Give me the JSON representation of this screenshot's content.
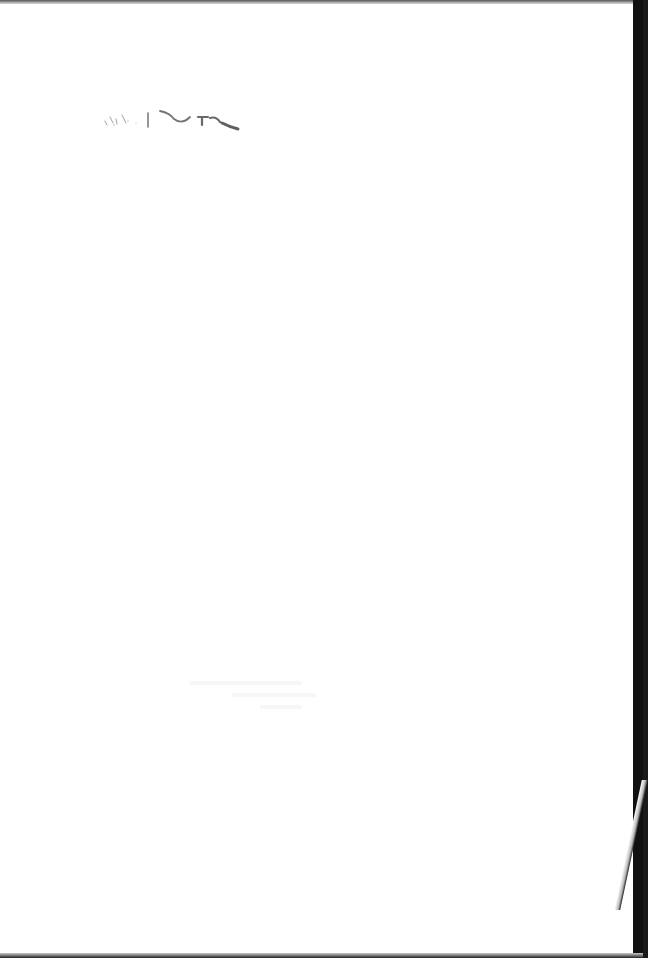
{
  "document": {
    "type": "scanned-page",
    "content": "blank",
    "marks": [
      {
        "name": "ink-smudge",
        "position": "top-left",
        "legible": false
      },
      {
        "name": "bleed-through",
        "position": "center-lower",
        "legible": false
      }
    ]
  },
  "colors": {
    "paper": "#ffffff",
    "border": "#111111",
    "ink": "#333333"
  }
}
